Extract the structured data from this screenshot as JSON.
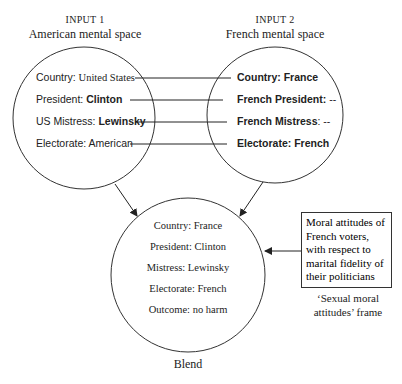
{
  "input1": {
    "label": "INPUT 1",
    "title": "American mental space",
    "items": [
      {
        "key": "Country: ",
        "value": "United States",
        "bold_key": false,
        "bold_value": false,
        "key_font": "sans",
        "value_font": "serif"
      },
      {
        "key": "President: ",
        "value": "Clinton",
        "bold_key": false,
        "bold_value": true
      },
      {
        "key": "US Mistress: ",
        "value": "Lewinsky",
        "bold_key": false,
        "bold_value": true
      },
      {
        "key": "Electorate: ",
        "value": "American",
        "bold_key": false,
        "bold_value": false
      }
    ]
  },
  "input2": {
    "label": "INPUT 2",
    "title": "French mental space",
    "items": [
      {
        "key": "Country: ",
        "value": "France"
      },
      {
        "key": "French President: ",
        "value": "--"
      },
      {
        "key": "French Mistress",
        "value": ": --"
      },
      {
        "key": "Electorate: ",
        "value": "French"
      }
    ]
  },
  "blend": {
    "label": "Blend",
    "items": [
      "Country: France",
      "President: Clinton",
      "Mistress: Lewinsky",
      "Electorate: French",
      "Outcome: no harm"
    ]
  },
  "frame": {
    "text_lines": [
      "Moral attitudes of",
      "French voters,",
      "with respect to",
      "marital fidelity of",
      "their politicians"
    ],
    "caption_lines": [
      "‘Sexual moral",
      "attitudes’ frame"
    ]
  },
  "colors": {
    "stroke": "#333333",
    "text": "#222222"
  }
}
